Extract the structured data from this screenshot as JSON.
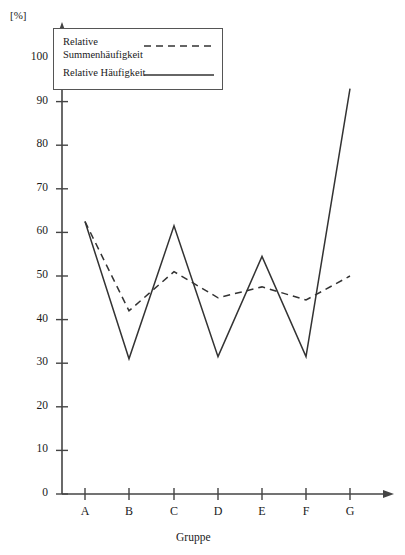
{
  "chart_data": {
    "type": "line",
    "title": "",
    "xlabel": "Gruppe",
    "ylabel": "[%]",
    "categories": [
      "A",
      "B",
      "C",
      "D",
      "E",
      "F",
      "G"
    ],
    "series": [
      {
        "name": "Relative Summenhäufigkeit",
        "style": "dashed",
        "color": "#333333",
        "values": [
          62.5,
          42.0,
          51.0,
          45.0,
          47.5,
          44.5,
          50.0
        ]
      },
      {
        "name": "Relative Häufigkeit",
        "style": "solid",
        "color": "#333333",
        "values": [
          62.5,
          31.0,
          61.5,
          31.5,
          54.5,
          31.5,
          93.0
        ]
      }
    ],
    "ylim": [
      0,
      105
    ],
    "yticks": [
      0,
      10,
      20,
      30,
      40,
      50,
      60,
      70,
      80,
      90,
      100
    ],
    "ytick_labels": [
      "0",
      "10",
      "20",
      "30",
      "40",
      "50",
      "60",
      "70",
      "80",
      "90",
      "100"
    ],
    "grid": false,
    "legend_position": "top-left"
  },
  "legend": {
    "entries": [
      {
        "label_line1": "Relative",
        "label_line2": "Summenhäufigkeit",
        "style": "dashed"
      },
      {
        "label_line1": "Relative Häufigkeit",
        "label_line2": "",
        "style": "solid"
      }
    ]
  },
  "axes": {
    "unit": "[%]",
    "x_title": "Gruppe"
  },
  "colors": {
    "axis": "#444444",
    "series": "#333333",
    "legend_border": "#555555",
    "background": "#ffffff"
  }
}
